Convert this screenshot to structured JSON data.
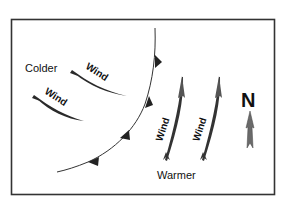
{
  "diagram": {
    "type": "weather-front-map",
    "frame": {
      "x": 11,
      "y": 19,
      "width": 264,
      "height": 176,
      "stroke": "#333333"
    },
    "labels": {
      "colder": "Colder",
      "warmer": "Warmer",
      "north": "N"
    },
    "front": {
      "kind": "cold-front",
      "color": "#222222",
      "triangle_count": 4
    },
    "winds": [
      {
        "label": "Wind",
        "region": "colder",
        "direction": "toward-southeast"
      },
      {
        "label": "Wind",
        "region": "colder",
        "direction": "toward-southeast"
      },
      {
        "label": "Wind",
        "region": "warmer",
        "direction": "toward-north"
      },
      {
        "label": "Wind",
        "region": "warmer",
        "direction": "toward-north"
      }
    ],
    "colors": {
      "arrow_dark": "#2a2a2a",
      "arrow_mid": "#555555",
      "compass_arrow": "#6a6a6a"
    }
  }
}
